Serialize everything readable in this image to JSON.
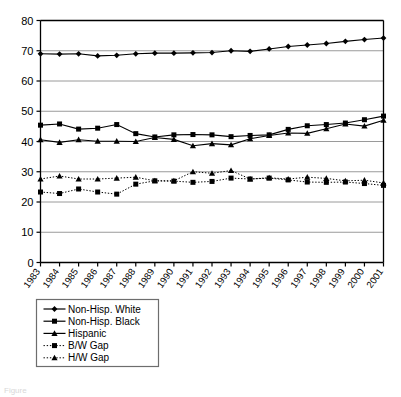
{
  "chart_data": {
    "type": "line",
    "title": "",
    "subtitle": "",
    "xlabel": "",
    "ylabel": "",
    "xlim_labels": [
      "1983",
      "2001"
    ],
    "ylim": [
      0,
      80
    ],
    "ytick_step": 10,
    "yticks": [
      0,
      10,
      20,
      30,
      40,
      50,
      60,
      70,
      80
    ],
    "grid": "horizontal",
    "legend_position": "below-axis-left",
    "categories": [
      "1983",
      "1984",
      "1985",
      "1986",
      "1987",
      "1988",
      "1989",
      "1990",
      "1991",
      "1992",
      "1993",
      "1994",
      "1995",
      "1996",
      "1997",
      "1998",
      "1999",
      "2000",
      "2001"
    ],
    "series": [
      {
        "name": "Non-Hisp. White",
        "marker": "diamond",
        "line": "solid",
        "color": "#000000",
        "values": [
          69.0,
          68.9,
          69.0,
          68.3,
          68.5,
          69.0,
          69.2,
          69.2,
          69.3,
          69.4,
          70.0,
          69.8,
          70.6,
          71.4,
          71.9,
          72.4,
          73.1,
          73.7,
          74.2
        ]
      },
      {
        "name": "Non-Hisp. Black",
        "marker": "square",
        "line": "solid",
        "color": "#000000",
        "values": [
          45.4,
          45.8,
          44.1,
          44.4,
          45.6,
          42.6,
          41.5,
          42.2,
          42.3,
          42.2,
          41.6,
          42.0,
          42.2,
          44.0,
          45.2,
          45.6,
          46.1,
          47.2,
          48.4
        ]
      },
      {
        "name": "Hispanic",
        "marker": "triangle",
        "line": "solid",
        "color": "#000000",
        "values": [
          40.6,
          39.7,
          40.6,
          40.1,
          40.1,
          40.0,
          41.3,
          40.7,
          38.6,
          39.3,
          38.9,
          40.9,
          42.0,
          42.8,
          42.7,
          44.2,
          45.8,
          45.1,
          47.0
        ]
      },
      {
        "name": "B/W Gap",
        "marker": "square",
        "line": "dotted",
        "color": "#000000",
        "values": [
          23.3,
          22.8,
          24.3,
          23.3,
          22.6,
          25.9,
          27.0,
          26.9,
          26.5,
          26.8,
          27.9,
          27.6,
          27.9,
          27.3,
          26.6,
          26.5,
          26.6,
          26.1,
          25.5
        ]
      },
      {
        "name": "H/W Gap",
        "marker": "triangle",
        "line": "dotted",
        "color": "#000000",
        "values": [
          27.6,
          28.6,
          27.6,
          27.6,
          27.9,
          28.2,
          27.0,
          27.0,
          30.0,
          29.5,
          30.4,
          27.6,
          28.0,
          27.6,
          28.2,
          27.8,
          27.0,
          27.2,
          26.3
        ]
      }
    ]
  },
  "legend": {
    "items": [
      {
        "label": "Non-Hisp. White"
      },
      {
        "label": "Non-Hisp. Black"
      },
      {
        "label": "Hispanic"
      },
      {
        "label": "B/W Gap"
      },
      {
        "label": "H/W Gap"
      }
    ]
  },
  "caption": {
    "text": "Figure"
  },
  "colors": {
    "axis": "#000000",
    "grid": "#9a9a9a",
    "plot_bg": "#ffffff",
    "legend_border": "#6d6d6d"
  }
}
